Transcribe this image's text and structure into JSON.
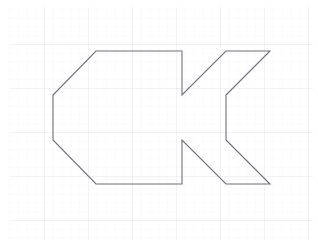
{
  "canvas": {
    "width": 318,
    "height": 244,
    "background_color": "#ffffff",
    "title": "polygon-on-grid"
  },
  "grid": {
    "visible": true,
    "minor_spacing": 8.8,
    "major_spacing": 44,
    "minor_color": "#f2f2f5",
    "major_color": "#e8e8ee",
    "minor_width": 0.5,
    "major_width": 0.8,
    "origin_x": 9,
    "origin_y": 7
  },
  "shape": {
    "name": "concave-polygon",
    "stroke_color": "#6e6e78",
    "stroke_width": 1.1,
    "fill": "none",
    "closed": true,
    "vertex_count": 12,
    "points": [
      [
        96,
        51
      ],
      [
        182,
        51
      ],
      [
        182,
        95
      ],
      [
        226,
        51
      ],
      [
        270,
        51
      ],
      [
        226,
        95
      ],
      [
        226,
        140
      ],
      [
        270,
        184
      ],
      [
        226,
        184
      ],
      [
        182,
        140
      ],
      [
        182,
        184
      ],
      [
        96,
        184
      ],
      [
        53,
        140
      ],
      [
        53,
        95
      ]
    ],
    "points_string": "96,51 182,51 182,95 226,51 270,51 226,95 226,140 270,184 226,184 182,140 182,184 96,184 53,140 53,95"
  }
}
